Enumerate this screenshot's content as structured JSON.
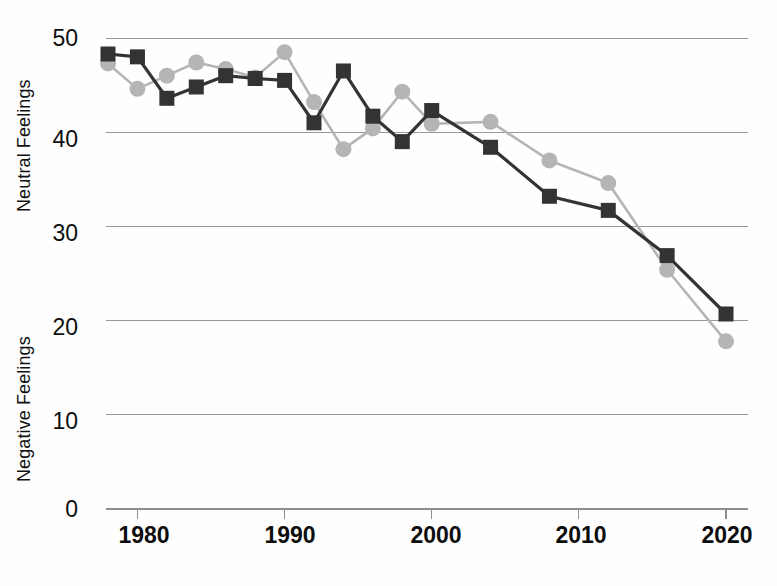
{
  "chart_data": {
    "type": "line",
    "title": "",
    "xlabel": "",
    "ylabel_top": "Neutral Feelings",
    "ylabel_bottom": "Negative Feelings",
    "grid": true,
    "legend": "none",
    "xlim": [
      1977,
      2021
    ],
    "ylim": [
      0,
      52
    ],
    "xticks": [
      1980,
      1990,
      2000,
      2010,
      2020
    ],
    "xtick_labels": [
      "1980",
      "1990",
      "2000",
      "2010",
      "2020"
    ],
    "yticks": [
      0,
      10,
      20,
      30,
      40,
      50
    ],
    "ytick_labels": [
      "0",
      "10",
      "20",
      "30",
      "40",
      "50"
    ],
    "series": [
      {
        "name": "dark-square-series",
        "color": "#333333",
        "marker": "square",
        "x": [
          1978,
          1980,
          1982,
          1984,
          1986,
          1988,
          1990,
          1992,
          1994,
          1996,
          1998,
          2000,
          2004,
          2008,
          2012,
          2016,
          2020
        ],
        "values": [
          48.3,
          48.0,
          43.6,
          44.8,
          46.0,
          45.7,
          45.5,
          41.0,
          46.5,
          41.7,
          39.0,
          42.3,
          38.4,
          33.2,
          31.7,
          26.9,
          20.7
        ]
      },
      {
        "name": "light-gray-circle-series",
        "color": "#b5b5b5",
        "marker": "circle",
        "x": [
          1978,
          1980,
          1982,
          1984,
          1986,
          1988,
          1990,
          1992,
          1994,
          1996,
          1998,
          2000,
          2004,
          2008,
          2012,
          2016,
          2020
        ],
        "values": [
          47.3,
          44.6,
          46.0,
          47.4,
          46.7,
          45.8,
          48.5,
          43.2,
          38.2,
          40.4,
          44.3,
          40.9,
          41.1,
          37.0,
          34.6,
          25.4,
          17.8
        ]
      }
    ]
  },
  "axes": {
    "y_label_top": "Neutral Feelings",
    "y_label_bottom": "Negative Feelings",
    "y_tick_50": "50",
    "y_tick_40": "40",
    "y_tick_30": "30",
    "y_tick_20": "20",
    "y_tick_10": "10",
    "y_tick_0": "0",
    "x_tick_1980": "1980",
    "x_tick_1990": "1990",
    "x_tick_2000": "2000",
    "x_tick_2010": "2010",
    "x_tick_2020": "2020"
  },
  "colors": {
    "dark_series": "#333333",
    "light_series": "#b5b5b5",
    "gridline": "#9a9a9a",
    "background": "#fefefe",
    "text": "#0d0d0d"
  }
}
